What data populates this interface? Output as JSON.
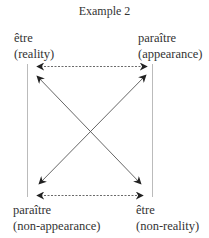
{
  "title": "Example 2",
  "corners": {
    "top_left": {
      "term": "être",
      "gloss": "(reality)"
    },
    "top_right": {
      "term": "paraître",
      "gloss": "(appearance)"
    },
    "bottom_left": {
      "term": "paraître",
      "gloss": "(non-appearance)"
    },
    "bottom_right": {
      "term": "être",
      "gloss": "(non-reality)"
    }
  },
  "relations": [
    {
      "type": "contrariety",
      "from": "top_left",
      "to": "top_right",
      "style": "dashed-double-arrow"
    },
    {
      "type": "subcontrariety",
      "from": "bottom_left",
      "to": "bottom_right",
      "style": "dashed-double-arrow"
    },
    {
      "type": "contradiction",
      "from": "bottom_right",
      "to": "top_left",
      "style": "solid-arrow"
    },
    {
      "type": "contradiction",
      "from": "bottom_left",
      "to": "top_right",
      "style": "solid-arrow"
    },
    {
      "type": "contradiction",
      "from": "top_left",
      "to": "bottom_right",
      "style": "solid-arrow"
    },
    {
      "type": "contradiction",
      "from": "top_right",
      "to": "bottom_left",
      "style": "solid-arrow"
    },
    {
      "type": "implication",
      "from": "top_left",
      "to": "bottom_left",
      "style": "thin-line"
    },
    {
      "type": "implication",
      "from": "top_right",
      "to": "bottom_right",
      "style": "thin-line"
    }
  ],
  "colors": {
    "line": "#555555",
    "vertical": "#bbbbbb",
    "text": "#333333"
  }
}
